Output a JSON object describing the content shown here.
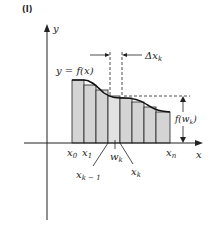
{
  "figure": {
    "panel_label": "(I)",
    "axis_labels": {
      "x": "x",
      "y": "y"
    },
    "curve_label": "y = f(x)",
    "delta_label": "Δx",
    "delta_sub": "k",
    "height_label": "f(w",
    "height_sub": "k",
    "height_close": ")",
    "tick_labels": {
      "x0": "x",
      "x0_sub": "0",
      "x1": "x",
      "x1_sub": "1",
      "xk1": "x",
      "xk1_sub": "k − 1",
      "wk": "w",
      "wk_sub": "k",
      "xk": "x",
      "xk_sub": "k",
      "xn": "x",
      "xn_sub": "n"
    },
    "colors": {
      "bar_fill": "#d4d4d4",
      "line": "#222222",
      "curve": "#111111"
    }
  }
}
